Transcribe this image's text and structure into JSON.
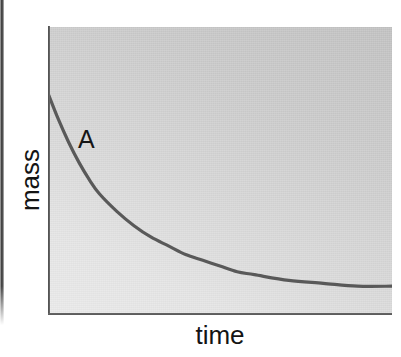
{
  "figure": {
    "y_axis_title": "mass",
    "x_axis_title": "time",
    "curve_label": "A",
    "colors": {
      "curve": "#595959",
      "axis": "#3a3a3a",
      "plot_background_dark": "#c2c2c2",
      "plot_background_light": "#ebebeb",
      "text": "#141414",
      "page_background": "#ffffff"
    }
  },
  "chart_data": {
    "type": "line",
    "title": "",
    "subtitle": "",
    "xlabel": "time",
    "ylabel": "mass",
    "grid": false,
    "legend_position": "inline-annotation",
    "axis_ticks": {
      "x": [],
      "y": []
    },
    "xlim": [
      0,
      1
    ],
    "ylim": [
      0,
      1
    ],
    "annotations": [
      {
        "text": "A",
        "x": 0.1,
        "y": 0.61,
        "describes": "decay-curve"
      }
    ],
    "series": [
      {
        "name": "A",
        "description": "mass decreasing over time, exponential decay to a non-zero plateau",
        "x": [
          0.0,
          0.03,
          0.06,
          0.09,
          0.12,
          0.15,
          0.2,
          0.25,
          0.3,
          0.35,
          0.4,
          0.45,
          0.5,
          0.55,
          0.6,
          0.7,
          0.8,
          0.9,
          1.0
        ],
        "y": [
          0.77,
          0.68,
          0.6,
          0.53,
          0.47,
          0.42,
          0.36,
          0.31,
          0.27,
          0.24,
          0.21,
          0.19,
          0.17,
          0.15,
          0.14,
          0.12,
          0.11,
          0.1,
          0.1
        ]
      }
    ]
  }
}
